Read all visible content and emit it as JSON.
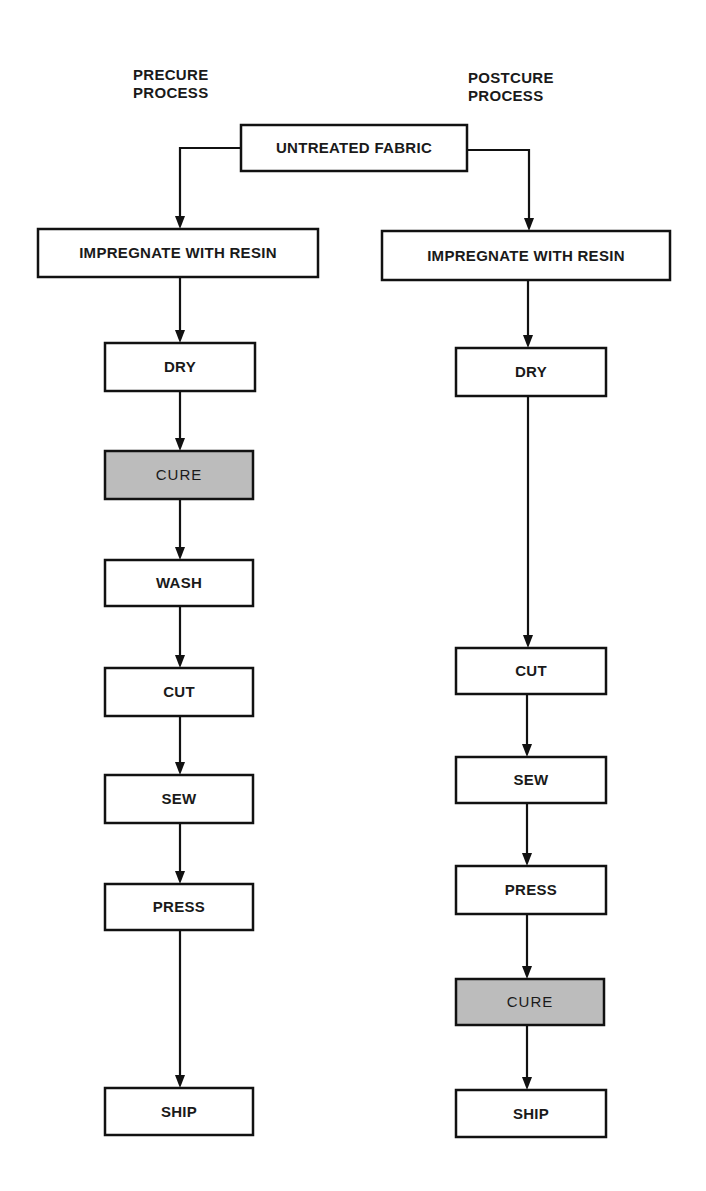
{
  "headings": {
    "left": [
      "PRECURE",
      "PROCESS"
    ],
    "right": [
      "POSTCURE",
      "PROCESS"
    ]
  },
  "colors": {
    "line": "#111111",
    "box_fill": "#ffffff",
    "cure_fill": "#bcbcbc",
    "text": "#1a1a1a"
  },
  "nodes": [
    {
      "id": "untreated",
      "label": "UNTREATED FABRIC",
      "x": 241,
      "y": 125,
      "w": 226,
      "h": 46,
      "highlight": false
    },
    {
      "id": "l_impregnate",
      "label": "IMPREGNATE WITH RESIN",
      "x": 38,
      "y": 229,
      "w": 280,
      "h": 48,
      "highlight": false
    },
    {
      "id": "l_dry",
      "label": "DRY",
      "x": 105,
      "y": 343,
      "w": 150,
      "h": 48,
      "highlight": false
    },
    {
      "id": "l_cure",
      "label": "CURE",
      "x": 105,
      "y": 451,
      "w": 148,
      "h": 48,
      "highlight": true
    },
    {
      "id": "l_wash",
      "label": "WASH",
      "x": 105,
      "y": 560,
      "w": 148,
      "h": 46,
      "highlight": false
    },
    {
      "id": "l_cut",
      "label": "CUT",
      "x": 105,
      "y": 668,
      "w": 148,
      "h": 48,
      "highlight": false
    },
    {
      "id": "l_sew",
      "label": "SEW",
      "x": 105,
      "y": 775,
      "w": 148,
      "h": 48,
      "highlight": false
    },
    {
      "id": "l_press",
      "label": "PRESS",
      "x": 105,
      "y": 884,
      "w": 148,
      "h": 46,
      "highlight": false
    },
    {
      "id": "l_ship",
      "label": "SHIP",
      "x": 105,
      "y": 1088,
      "w": 148,
      "h": 47,
      "highlight": false
    },
    {
      "id": "r_impregnate",
      "label": "IMPREGNATE WITH RESIN",
      "x": 382,
      "y": 231,
      "w": 288,
      "h": 49,
      "highlight": false
    },
    {
      "id": "r_dry",
      "label": "DRY",
      "x": 456,
      "y": 348,
      "w": 150,
      "h": 48,
      "highlight": false
    },
    {
      "id": "r_cut",
      "label": "CUT",
      "x": 456,
      "y": 648,
      "w": 150,
      "h": 46,
      "highlight": false
    },
    {
      "id": "r_sew",
      "label": "SEW",
      "x": 456,
      "y": 757,
      "w": 150,
      "h": 46,
      "highlight": false
    },
    {
      "id": "r_press",
      "label": "PRESS",
      "x": 456,
      "y": 866,
      "w": 150,
      "h": 48,
      "highlight": false
    },
    {
      "id": "r_cure",
      "label": "CURE",
      "x": 456,
      "y": 979,
      "w": 148,
      "h": 46,
      "highlight": true
    },
    {
      "id": "r_ship",
      "label": "SHIP",
      "x": 456,
      "y": 1090,
      "w": 150,
      "h": 47,
      "highlight": false
    }
  ],
  "edges": [
    {
      "from": "untreated",
      "to": "l_impregnate",
      "points": [
        [
          241,
          148
        ],
        [
          180,
          148
        ],
        [
          180,
          229
        ]
      ]
    },
    {
      "from": "untreated",
      "to": "r_impregnate",
      "points": [
        [
          467,
          150
        ],
        [
          529,
          150
        ],
        [
          529,
          231
        ]
      ]
    },
    {
      "from": "l_impregnate",
      "to": "l_dry",
      "points": [
        [
          180,
          277
        ],
        [
          180,
          343
        ]
      ]
    },
    {
      "from": "l_dry",
      "to": "l_cure",
      "points": [
        [
          180,
          391
        ],
        [
          180,
          451
        ]
      ]
    },
    {
      "from": "l_cure",
      "to": "l_wash",
      "points": [
        [
          180,
          499
        ],
        [
          180,
          560
        ]
      ]
    },
    {
      "from": "l_wash",
      "to": "l_cut",
      "points": [
        [
          180,
          606
        ],
        [
          180,
          668
        ]
      ]
    },
    {
      "from": "l_cut",
      "to": "l_sew",
      "points": [
        [
          180,
          716
        ],
        [
          180,
          775
        ]
      ]
    },
    {
      "from": "l_sew",
      "to": "l_press",
      "points": [
        [
          180,
          823
        ],
        [
          180,
          884
        ]
      ]
    },
    {
      "from": "l_press",
      "to": "l_ship",
      "points": [
        [
          180,
          930
        ],
        [
          180,
          1088
        ]
      ]
    },
    {
      "from": "r_impregnate",
      "to": "r_dry",
      "points": [
        [
          528,
          280
        ],
        [
          528,
          348
        ]
      ]
    },
    {
      "from": "r_dry",
      "to": "r_cut",
      "points": [
        [
          528,
          396
        ],
        [
          528,
          648
        ]
      ]
    },
    {
      "from": "r_cut",
      "to": "r_sew",
      "points": [
        [
          527,
          694
        ],
        [
          527,
          757
        ]
      ]
    },
    {
      "from": "r_sew",
      "to": "r_press",
      "points": [
        [
          527,
          803
        ],
        [
          527,
          866
        ]
      ]
    },
    {
      "from": "r_press",
      "to": "r_cure",
      "points": [
        [
          527,
          914
        ],
        [
          527,
          979
        ]
      ]
    },
    {
      "from": "r_cure",
      "to": "r_ship",
      "points": [
        [
          527,
          1025
        ],
        [
          527,
          1090
        ]
      ]
    }
  ]
}
